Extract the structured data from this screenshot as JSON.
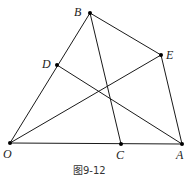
{
  "figure": {
    "caption": "图9-12",
    "points": [
      {
        "id": "O",
        "label": "O",
        "x": 10,
        "y": 143,
        "lx": 3,
        "ly": 158
      },
      {
        "id": "B",
        "label": "B",
        "x": 90,
        "y": 13,
        "lx": 74,
        "ly": 16
      },
      {
        "id": "E",
        "label": "E",
        "x": 161,
        "y": 55,
        "lx": 166,
        "ly": 59
      },
      {
        "id": "D",
        "label": "D",
        "x": 57,
        "y": 65,
        "lx": 42,
        "ly": 68
      },
      {
        "id": "C",
        "label": "C",
        "x": 121,
        "y": 144,
        "lx": 116,
        "ly": 159
      },
      {
        "id": "A",
        "label": "A",
        "x": 182,
        "y": 144,
        "lx": 176,
        "ly": 159
      }
    ],
    "segments": [
      [
        "O",
        "B"
      ],
      [
        "O",
        "A"
      ],
      [
        "B",
        "E"
      ],
      [
        "E",
        "A"
      ],
      [
        "B",
        "C"
      ],
      [
        "D",
        "A"
      ],
      [
        "O",
        "E"
      ]
    ]
  }
}
